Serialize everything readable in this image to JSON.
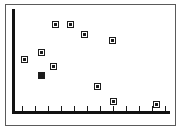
{
  "chart_data": {
    "type": "scatter",
    "title": "",
    "subtitle": "",
    "xlabel": "",
    "ylabel": "",
    "grid": false,
    "legend": null,
    "xlim": [
      0,
      12
    ],
    "ylim": [
      0,
      10
    ],
    "axis_style": "L-shaped spines, ticks on x-axis only, no tick labels",
    "x_tick_count": 12,
    "x_ticks": [
      1,
      2,
      3,
      4,
      5,
      6,
      7,
      8,
      9,
      10,
      11,
      12
    ],
    "x_tick_labels": [],
    "y_tick_labels": [],
    "marker_style": "open-square",
    "series": [
      {
        "name": "series-1",
        "points": [
          {
            "x": 1.0,
            "y": 4.6,
            "px": 24,
            "py": 59,
            "style": "open-square"
          },
          {
            "x": 2.3,
            "y": 5.4,
            "px": 41,
            "py": 52,
            "style": "open-square"
          },
          {
            "x": 2.3,
            "y": 3.4,
            "px": 41,
            "py": 75,
            "style": "filled-square"
          },
          {
            "x": 3.2,
            "y": 4.1,
            "px": 53,
            "py": 66,
            "style": "open-square"
          },
          {
            "x": 3.3,
            "y": 8.0,
            "px": 55,
            "py": 24,
            "style": "open-square"
          },
          {
            "x": 4.5,
            "y": 8.0,
            "px": 70,
            "py": 24,
            "style": "open-square"
          },
          {
            "x": 5.5,
            "y": 7.2,
            "px": 84,
            "py": 34,
            "style": "open-square"
          },
          {
            "x": 7.5,
            "y": 6.7,
            "px": 112,
            "py": 40,
            "style": "open-square"
          },
          {
            "x": 6.4,
            "y": 2.5,
            "px": 97,
            "py": 86,
            "style": "open-square"
          },
          {
            "x": 7.6,
            "y": 1.1,
            "px": 113,
            "py": 101,
            "style": "open-square"
          },
          {
            "x": 10.6,
            "y": 0.8,
            "px": 156,
            "py": 104,
            "style": "open-square"
          },
          {
            "x": 2.9,
            "y": 6.1,
            "px": 49,
            "py": 44,
            "style": "hidden"
          }
        ]
      }
    ],
    "colors": {
      "frame": "#5a5a5a",
      "axis": "#111111",
      "marker_edge": "#1c1c1c",
      "marker_fill": "#ffffff",
      "background": "#ffffff"
    }
  },
  "ticks": {
    "x_positions_px": [
      22,
      35,
      48,
      61,
      74,
      87,
      100,
      113,
      126,
      139,
      152,
      165
    ]
  }
}
